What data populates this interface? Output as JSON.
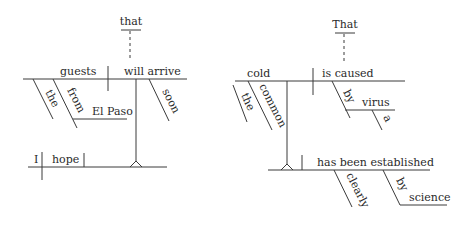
{
  "diagrams": [
    {
      "sentence": "I hope that guests from El Paso will arrive soon.",
      "words": {
        "connector": "that",
        "clause_subject": "guests",
        "clause_verb": "will arrive",
        "modifier_article": "the",
        "preposition": "from",
        "prep_object": "El Paso",
        "adverb": "soon",
        "main_subject": "I",
        "main_verb": "hope"
      }
    },
    {
      "sentence": "That a virus causes the common cold has been clearly established by science.",
      "words": {
        "connector": "That",
        "clause_subject": "cold",
        "clause_verb": "is caused",
        "modifier_article": "the",
        "adjective": "common",
        "preposition": "by",
        "prep_object": "virus",
        "prep_object_article": "a",
        "main_verb": "has been established",
        "adverb": "clearly",
        "preposition2": "by",
        "prep_object2": "science"
      }
    }
  ]
}
